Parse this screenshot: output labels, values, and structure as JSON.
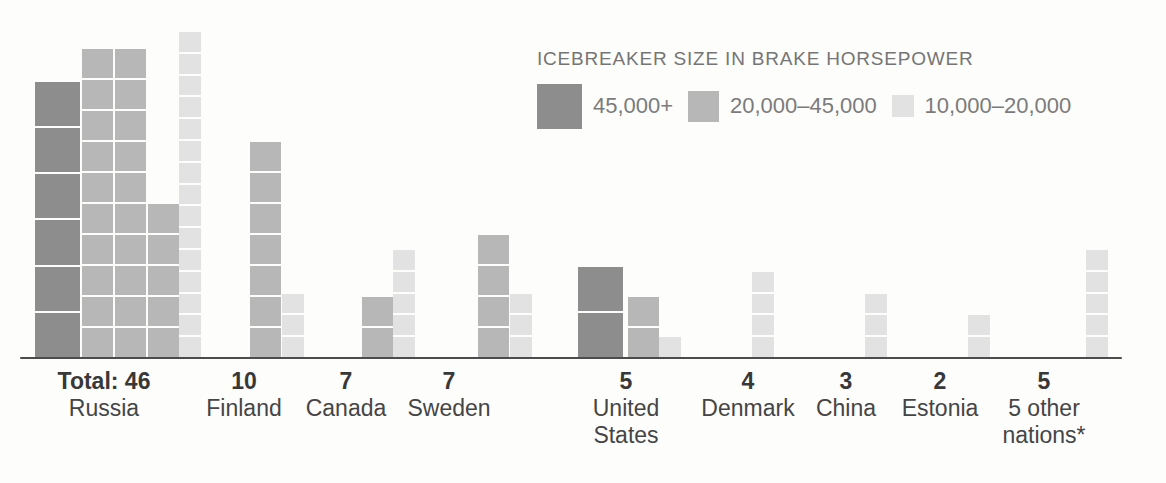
{
  "colors": {
    "dark": "#8d8d8d",
    "medium": "#b7b7b7",
    "light": "#e2e2e2",
    "baseline": "#4c4c4c",
    "label_text": "#383838",
    "legend_text": "#757575",
    "background": "#fdfdfc"
  },
  "legend": {
    "title": "ICEBREAKER SIZE IN BRAKE HORSEPOWER",
    "items": [
      {
        "label": "45,000+",
        "type": "dark"
      },
      {
        "label": "20,000–45,000",
        "type": "medium"
      },
      {
        "label": "10,000–20,000",
        "type": "light"
      }
    ]
  },
  "chart_data": {
    "type": "bar",
    "subtype": "unit-pictogram",
    "title": "ICEBREAKER SIZE IN BRAKE HORSEPOWER",
    "unit": "1 square = 1 icebreaker ship",
    "categories": [
      "Russia",
      "Finland",
      "Canada",
      "Sweden",
      "United States",
      "Denmark",
      "China",
      "Estonia",
      "5 other nations*"
    ],
    "totals": [
      46,
      10,
      7,
      7,
      5,
      4,
      3,
      2,
      5
    ],
    "series": [
      {
        "name": "45,000+",
        "values": [
          6,
          0,
          0,
          0,
          2,
          0,
          0,
          0,
          0
        ]
      },
      {
        "name": "20,000–45,000",
        "values": [
          25,
          7,
          2,
          4,
          2,
          0,
          0,
          0,
          0
        ]
      },
      {
        "name": "10,000–20,000",
        "values": [
          15,
          3,
          5,
          3,
          1,
          4,
          3,
          2,
          5
        ]
      }
    ],
    "legend_position": "top-right",
    "grid": false,
    "note": "Square size scales with horsepower class; larger squares = larger ships"
  },
  "countries": [
    {
      "id": "russia",
      "total_label": "Total: 46",
      "name_lines": [
        "Russia"
      ],
      "label_center": 104,
      "columns": [
        {
          "type": "dark",
          "count": 6,
          "x": 35
        },
        {
          "type": "medium",
          "count": 10,
          "x": 82
        },
        {
          "type": "medium",
          "count": 10,
          "x": 115
        },
        {
          "type": "medium",
          "count": 5,
          "x": 148
        },
        {
          "type": "light",
          "count": 15,
          "x": 179
        }
      ]
    },
    {
      "id": "finland",
      "total_label": "10",
      "name_lines": [
        "Finland"
      ],
      "label_center": 244,
      "columns": [
        {
          "type": "medium",
          "count": 7,
          "x": 250
        },
        {
          "type": "light",
          "count": 3,
          "x": 282
        }
      ]
    },
    {
      "id": "canada",
      "total_label": "7",
      "name_lines": [
        "Canada"
      ],
      "label_center": 346,
      "columns": [
        {
          "type": "medium",
          "count": 2,
          "x": 362
        },
        {
          "type": "light",
          "count": 5,
          "x": 393
        }
      ]
    },
    {
      "id": "sweden",
      "total_label": "7",
      "name_lines": [
        "Sweden"
      ],
      "label_center": 449,
      "columns": [
        {
          "type": "medium",
          "count": 4,
          "x": 478
        },
        {
          "type": "light",
          "count": 3,
          "x": 510
        }
      ]
    },
    {
      "id": "united-states",
      "total_label": "5",
      "name_lines": [
        "United",
        "States"
      ],
      "label_center": 626,
      "columns": [
        {
          "type": "dark",
          "count": 2,
          "x": 578
        },
        {
          "type": "medium",
          "count": 2,
          "x": 628
        },
        {
          "type": "light",
          "count": 1,
          "x": 659
        }
      ]
    },
    {
      "id": "denmark",
      "total_label": "4",
      "name_lines": [
        "Denmark"
      ],
      "label_center": 748,
      "columns": [
        {
          "type": "light",
          "count": 4,
          "x": 752
        }
      ]
    },
    {
      "id": "china",
      "total_label": "3",
      "name_lines": [
        "China"
      ],
      "label_center": 846,
      "columns": [
        {
          "type": "light",
          "count": 3,
          "x": 865
        }
      ]
    },
    {
      "id": "estonia",
      "total_label": "2",
      "name_lines": [
        "Estonia"
      ],
      "label_center": 940,
      "columns": [
        {
          "type": "light",
          "count": 2,
          "x": 968
        }
      ]
    },
    {
      "id": "other-nations",
      "total_label": "5",
      "name_lines": [
        "5 other",
        "nations*"
      ],
      "label_center": 1044,
      "columns": [
        {
          "type": "light",
          "count": 5,
          "x": 1086
        }
      ]
    }
  ]
}
